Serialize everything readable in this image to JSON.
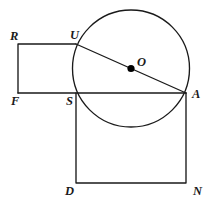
{
  "figure": {
    "background_color": "#ffffff",
    "stroke_color": "#1a1a1a",
    "dot_color": "#000000"
  },
  "circle": {
    "name": "circle-O",
    "center_x": 131,
    "center_y": 68.5,
    "radius": 58.5,
    "center_label": "O"
  },
  "points": [
    {
      "id": "R",
      "label": "R",
      "x": 18,
      "y": 44,
      "label_x": 10,
      "label_y": 30
    },
    {
      "id": "U",
      "label": "U",
      "x": 76,
      "y": 44,
      "label_x": 70,
      "label_y": 29
    },
    {
      "id": "O",
      "label": "O",
      "x": 131,
      "y": 68.5,
      "label_x": 137,
      "label_y": 56
    },
    {
      "id": "F",
      "label": "F",
      "x": 18,
      "y": 93,
      "label_x": 11,
      "label_y": 95
    },
    {
      "id": "S",
      "label": "S",
      "x": 76,
      "y": 93,
      "label_x": 66,
      "label_y": 95
    },
    {
      "id": "A",
      "label": "A",
      "x": 186,
      "y": 93,
      "label_x": 192,
      "label_y": 88
    },
    {
      "id": "D",
      "label": "D",
      "x": 76,
      "y": 183,
      "label_x": 65,
      "label_y": 185
    },
    {
      "id": "N",
      "label": "N",
      "x": 186,
      "y": 183,
      "label_x": 193,
      "label_y": 185
    }
  ],
  "segments": [
    {
      "name": "segment-R-U",
      "from": "R",
      "to": "U"
    },
    {
      "name": "segment-R-F",
      "from": "R",
      "to": "F"
    },
    {
      "name": "segment-F-A",
      "from": "F",
      "to": "A"
    },
    {
      "name": "segment-U-A",
      "from": "U",
      "to": "A"
    },
    {
      "name": "segment-S-D",
      "from": "S",
      "to": "D"
    },
    {
      "name": "segment-D-N",
      "from": "D",
      "to": "N"
    },
    {
      "name": "segment-N-A",
      "from": "N",
      "to": "A"
    }
  ],
  "paths": {
    "rectangle_RFSU": "M 18 44 L 76 44 M 18 44 L 18 93",
    "baseline_FA": "M 18 93 L 186 93",
    "diameter_UA": "M 76 44 L 186 93",
    "square_SAND": "M 76 93 L 76 183 L 186 183 L 186 93"
  }
}
